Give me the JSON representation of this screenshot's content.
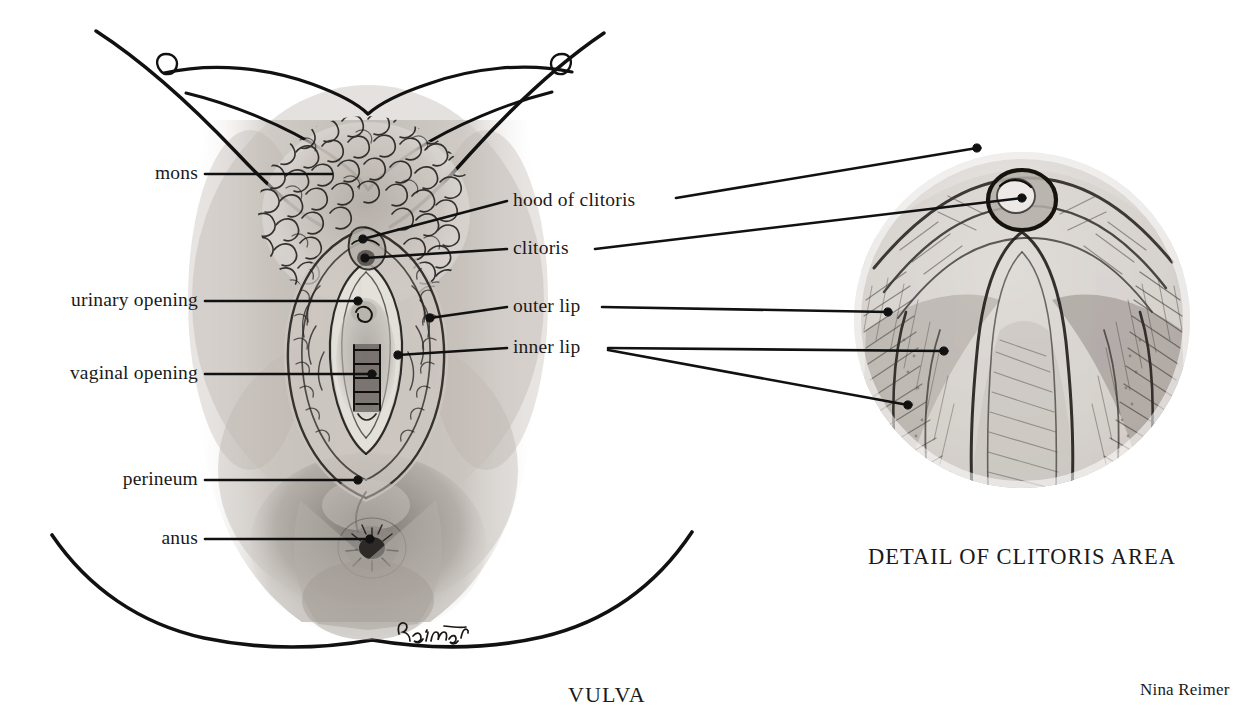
{
  "figure": {
    "title": "VULVA",
    "detail_title": "DETAIL OF CLITORIS AREA",
    "credit": "Nina Reimer",
    "artist_signature": "Reimer",
    "medium": "pencil drawing",
    "background_color": "#ffffff",
    "ink_color": "#1a1a1a"
  },
  "labels": {
    "mons": "mons",
    "urinary_opening": "urinary opening",
    "vaginal_opening": "vaginal opening",
    "perineum": "perineum",
    "anus": "anus",
    "hood_of_clitoris": "hood of clitoris",
    "clitoris": "clitoris",
    "outer_lip": "outer lip",
    "inner_lip": "inner lip"
  },
  "left_labels": [
    {
      "key": "mons",
      "text": "mons",
      "x": 198,
      "y": 178
    },
    {
      "key": "urinary-opening",
      "text": "urinary opening",
      "x": 198,
      "y": 305
    },
    {
      "key": "vaginal-opening",
      "text": "vaginal opening",
      "x": 198,
      "y": 378
    },
    {
      "key": "perineum",
      "text": "perineum",
      "x": 198,
      "y": 484
    },
    {
      "key": "anus",
      "text": "anus",
      "x": 198,
      "y": 543
    }
  ],
  "right_labels": [
    {
      "key": "hood-of-clitoris",
      "text": "hood of clitoris",
      "x": 513,
      "y": 205
    },
    {
      "key": "clitoris",
      "text": "clitoris",
      "x": 513,
      "y": 253
    },
    {
      "key": "outer-lip",
      "text": "outer lip",
      "x": 513,
      "y": 311
    },
    {
      "key": "inner-lip",
      "text": "inner lip",
      "x": 513,
      "y": 352
    }
  ],
  "leaders": [
    {
      "key": "mons",
      "from": [
        205,
        174
      ],
      "to": [
        332,
        174
      ],
      "dot": false
    },
    {
      "key": "urinary-opening",
      "from": [
        205,
        301
      ],
      "to": [
        358,
        301
      ],
      "dot": true
    },
    {
      "key": "vaginal-opening",
      "from": [
        205,
        374
      ],
      "to": [
        372,
        374
      ],
      "dot": true
    },
    {
      "key": "perineum",
      "from": [
        205,
        480
      ],
      "to": [
        358,
        480
      ],
      "dot": true
    },
    {
      "key": "anus",
      "from": [
        205,
        539
      ],
      "to": [
        370,
        539
      ],
      "dot": true
    },
    {
      "key": "hood-of-clitoris-main",
      "from": [
        507,
        201
      ],
      "to": [
        363,
        239
      ],
      "dot": true
    },
    {
      "key": "hood-of-clitoris-detail",
      "from": [
        676,
        198
      ],
      "to": [
        977,
        148
      ],
      "dot": true
    },
    {
      "key": "clitoris-main",
      "from": [
        507,
        249
      ],
      "to": [
        365,
        258
      ],
      "dot": true
    },
    {
      "key": "clitoris-detail",
      "from": [
        595,
        249
      ],
      "to": [
        1022,
        198
      ],
      "dot": true
    },
    {
      "key": "outer-lip-main",
      "from": [
        507,
        307
      ],
      "to": [
        430,
        318
      ],
      "dot": true
    },
    {
      "key": "outer-lip-detail",
      "from": [
        602,
        307
      ],
      "to": [
        888,
        312
      ],
      "dot": true
    },
    {
      "key": "inner-lip-main",
      "from": [
        507,
        348
      ],
      "to": [
        398,
        355
      ],
      "dot": true
    },
    {
      "key": "inner-lip-detail-a",
      "from": [
        608,
        348
      ],
      "to": [
        944,
        351
      ],
      "dot": true
    },
    {
      "key": "inner-lip-detail-b",
      "from": [
        608,
        350
      ],
      "to": [
        908,
        405
      ],
      "dot": true
    }
  ],
  "detail_circle": {
    "cx": 1022,
    "cy": 320,
    "r": 168
  },
  "captions": [
    {
      "key": "vulva",
      "text": "VULVA",
      "x": 568,
      "y": 700
    },
    {
      "key": "detail-of-clitoris-area",
      "text": "DETAIL OF CLITORIS AREA",
      "x": 868,
      "y": 562
    },
    {
      "key": "credit",
      "text": "Nina Reimer",
      "x": 1140,
      "y": 695
    }
  ]
}
